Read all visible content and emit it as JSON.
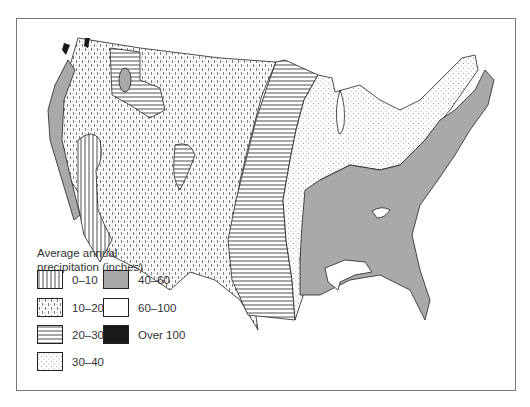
{
  "map": {
    "subject": "Average annual precipitation, contiguous United States",
    "legend": {
      "title_line1": "Average annual",
      "title_line2": "precipitation (inches)",
      "items": [
        {
          "label": "0–10",
          "pattern": "vertical-lines"
        },
        {
          "label": "10–20",
          "pattern": "dashes-dots"
        },
        {
          "label": "20–30",
          "pattern": "horizontal-lines"
        },
        {
          "label": "30–40",
          "pattern": "fine-dots"
        },
        {
          "label": "40–60",
          "pattern": "gray-fill",
          "color": "#a9a9a9"
        },
        {
          "label": "60–100",
          "pattern": "white",
          "color": "#ffffff"
        },
        {
          "label": "Over 100",
          "pattern": "black-fill",
          "color": "#1a1a1a"
        }
      ]
    },
    "colors": {
      "gray": "#a9a9a9",
      "black": "#1a1a1a",
      "line": "#222222"
    }
  }
}
